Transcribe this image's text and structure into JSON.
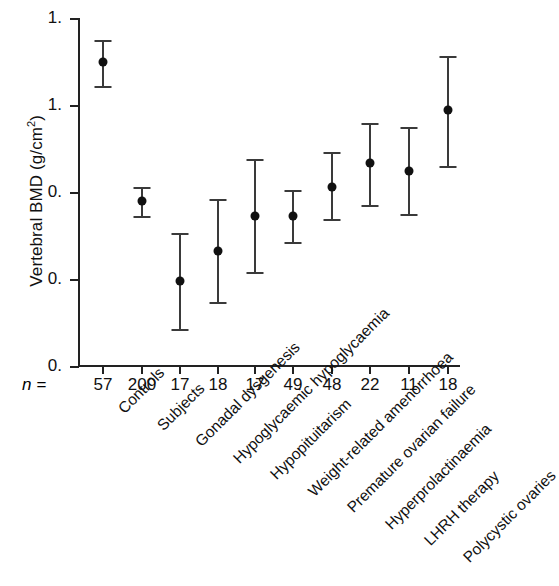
{
  "chart_data": {
    "type": "scatter",
    "title": "",
    "xlabel": "",
    "ylabel": "Vertebral BMD (g/cm",
    "ylabel_sup": "2",
    "ylabel_suffix": ")",
    "ylabel_full": "Vertebral BMD (g/cm2)",
    "ytick_labels": [
      "1.",
      "1.",
      "0.",
      "0.",
      "0."
    ],
    "ytick_note": "tick label fractional digits are cut off at the left edge of the scan",
    "ylim_pixels": [
      18,
      366
    ],
    "grid": false,
    "legend": null,
    "n_prefix": "n =",
    "categories": [
      "Controls",
      "Subjects",
      "Gonadal dysgenesis",
      "Hypoglycaemic hypoglycaemia",
      "Hypopituitarism",
      "Weight-related amenorrhoea",
      "Premature ovarian failure",
      "Hyperprolactinaemia",
      "LHRH therapy",
      "Polycystic ovaries"
    ],
    "n_values": [
      "57",
      "200",
      "17",
      "18",
      "17",
      "49",
      "48",
      "22",
      "11",
      "18"
    ],
    "points": [
      {
        "category": "Controls",
        "n": "57",
        "x_px": 103,
        "y_px": 62,
        "cap_top_px": 40,
        "cap_bottom_px": 86
      },
      {
        "category": "Subjects",
        "n": "200",
        "x_px": 142,
        "y_px": 201,
        "cap_top_px": 187,
        "cap_bottom_px": 216
      },
      {
        "category": "Gonadal dysgenesis",
        "n": "17",
        "x_px": 180,
        "y_px": 281,
        "cap_top_px": 233,
        "cap_bottom_px": 329
      },
      {
        "category": "Hypoglycaemic hypoglycaemia",
        "n": "18",
        "x_px": 218,
        "y_px": 251,
        "cap_top_px": 199,
        "cap_bottom_px": 302
      },
      {
        "category": "Hypopituitarism",
        "n": "17",
        "x_px": 255,
        "y_px": 216,
        "cap_top_px": 159,
        "cap_bottom_px": 272
      },
      {
        "category": "Weight-related amenorrhoea",
        "n": "49",
        "x_px": 293,
        "y_px": 216,
        "cap_top_px": 190,
        "cap_bottom_px": 242
      },
      {
        "category": "Premature ovarian failure",
        "n": "48",
        "x_px": 332,
        "y_px": 187,
        "cap_top_px": 152,
        "cap_bottom_px": 219
      },
      {
        "category": "Hyperprolactinaemia",
        "n": "22",
        "x_px": 370,
        "y_px": 163,
        "cap_top_px": 123,
        "cap_bottom_px": 205
      },
      {
        "category": "LHRH therapy",
        "n": "11",
        "x_px": 409,
        "y_px": 171,
        "cap_top_px": 127,
        "cap_bottom_px": 214
      },
      {
        "category": "Polycystic ovaries",
        "n": "18",
        "x_px": 448,
        "y_px": 110,
        "cap_top_px": 56,
        "cap_bottom_px": 166
      }
    ],
    "colors": {
      "marker": "#111111",
      "error_bar": "#3a3a3a",
      "axis": "#222222",
      "background": "#ffffff",
      "text": "#111111"
    }
  }
}
